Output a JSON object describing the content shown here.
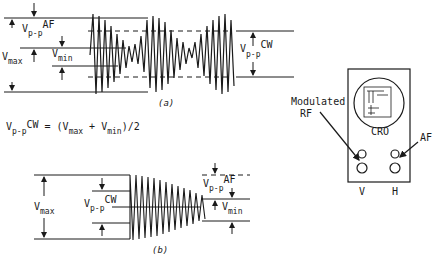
{
  "figure_a": {
    "caption": "(a)",
    "labels": {
      "vpp_af_main": "V",
      "vpp_af_sub": "p-p",
      "vpp_af_sup": "AF",
      "vmax_main": "V",
      "vmax_sub": "max",
      "vmin_main": "V",
      "vmin_sub": "min",
      "vpp_cw_main": "V",
      "vpp_cw_sub": "p-p",
      "vpp_cw_sup": "CW"
    }
  },
  "formula": {
    "v": "V",
    "pp": "p-p",
    "cw": "CW",
    "eq": " = (V",
    "max": "max",
    "plus": " + V",
    "min": "min",
    "tail": ")/2"
  },
  "figure_b": {
    "caption": "(b)",
    "labels": {
      "vmax_main": "V",
      "vmax_sub": "max",
      "vpp_cw_main": "V",
      "vpp_cw_sub": "p-p",
      "vpp_cw_sup": "CW",
      "vpp_af_main": "V",
      "vpp_af_sub": "p-p",
      "vpp_af_sup": "AF",
      "vmin_main": "V",
      "vmin_sub": "min"
    }
  },
  "cro": {
    "screen_label": "CRO",
    "input_left_label_line1": "Modulated",
    "input_left_label_line2": "RF",
    "input_right_label": "AF",
    "terminal_v": "V",
    "terminal_h": "H"
  },
  "colors": {
    "ink": "#1a1a1a",
    "background": "#ffffff"
  }
}
